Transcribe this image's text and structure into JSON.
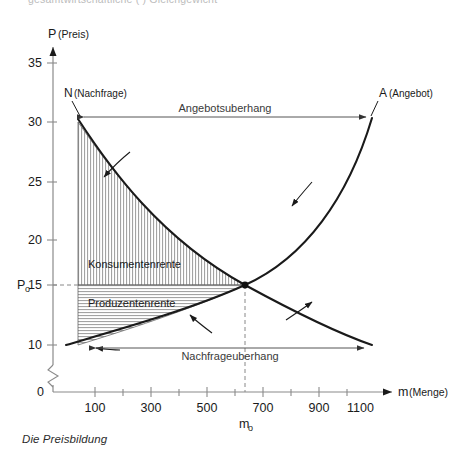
{
  "figure": {
    "clipped_header_text": "gesamtwirtschaftliche (  ) Gleichgewicht",
    "caption": "Die Preisbildung",
    "background": "#ffffff",
    "ink": "#1a1a1a"
  },
  "axes": {
    "y": {
      "label": "P",
      "sublabel": "(Preis)",
      "origin_label": "0",
      "has_break": true,
      "ticks": [
        {
          "value": 35,
          "label": "35"
        },
        {
          "value": 30,
          "label": "30"
        },
        {
          "value": 25,
          "label": "25"
        },
        {
          "value": 20,
          "label": "20"
        },
        {
          "value": 15,
          "label": "15"
        },
        {
          "value": 10,
          "label": "10"
        }
      ],
      "equilibrium_tick": {
        "symbol": "P",
        "subscript": "o",
        "value": 15
      }
    },
    "x": {
      "label": "m",
      "sublabel": "(Menge)",
      "ticks": [
        {
          "value": 100,
          "label": "100"
        },
        {
          "value": 300,
          "label": "300"
        },
        {
          "value": 500,
          "label": "500"
        },
        {
          "value": 700,
          "label": "700"
        },
        {
          "value": 900,
          "label": "900"
        },
        {
          "value": 1100,
          "label": "1100"
        }
      ],
      "minor_ticks": [
        200,
        400,
        600,
        800,
        1000
      ],
      "equilibrium_tick": {
        "symbol": "m",
        "subscript": "o",
        "value": 600
      }
    }
  },
  "curves": [
    {
      "id": "demand",
      "label": "N",
      "sublabel": "(Nachfrage)",
      "direction_arrows": 2
    },
    {
      "id": "supply",
      "label": "A",
      "sublabel": "(Angebot)",
      "direction_arrows": 2
    }
  ],
  "equilibrium": {
    "price": 15,
    "quantity": 600,
    "price_label": "P",
    "price_sub": "o",
    "quantity_label": "m",
    "quantity_sub": "o"
  },
  "regions": [
    {
      "id": "consumer-surplus",
      "label": "Konsumentenrente",
      "hatch": "vertical"
    },
    {
      "id": "producer-surplus",
      "label": "Produzentenrente",
      "hatch": "horizontal"
    }
  ],
  "annotations": [
    {
      "id": "excess-supply",
      "label": "Angebotsuberhang",
      "at_price": 30
    },
    {
      "id": "excess-demand",
      "label": "Nachfrageuberhang",
      "at_price": 10
    }
  ]
}
